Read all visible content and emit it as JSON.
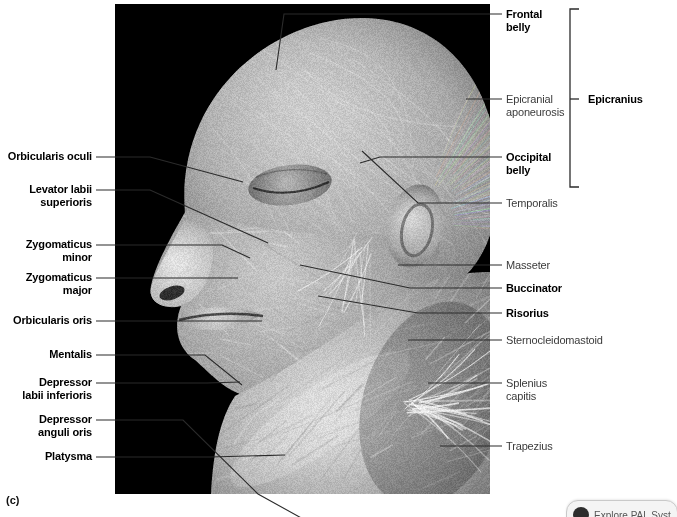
{
  "figure": {
    "panel_letter": "(c)",
    "photo": {
      "kind": "cadaver-dissection-photograph",
      "subject": "lateral view of human head and neck, superficial muscles",
      "palette": "grayscale",
      "background_color": "#000000"
    }
  },
  "labels_left": [
    {
      "id": "orbicularis-oculi",
      "text": "Orbicularis oculi",
      "weight": "bold",
      "text_right_x": 92,
      "text_y": 150,
      "lines": 1,
      "leader": [
        [
          96,
          157
        ],
        [
          150,
          157
        ],
        [
          243,
          182
        ]
      ]
    },
    {
      "id": "levator-labii-superioris",
      "text": "Levator labii\nsuperioris",
      "weight": "bold",
      "text_right_x": 92,
      "text_y": 183,
      "lines": 2,
      "leader": [
        [
          96,
          190
        ],
        [
          150,
          190
        ],
        [
          268,
          243
        ]
      ]
    },
    {
      "id": "zygomaticus-minor",
      "text": "Zygomaticus\nminor",
      "weight": "bold",
      "text_right_x": 92,
      "text_y": 238,
      "lines": 2,
      "leader": [
        [
          96,
          245
        ],
        [
          222,
          245
        ],
        [
          250,
          258
        ]
      ]
    },
    {
      "id": "zygomaticus-major",
      "text": "Zygomaticus\nmajor",
      "weight": "bold",
      "text_right_x": 92,
      "text_y": 271,
      "lines": 2,
      "leader": [
        [
          96,
          278
        ],
        [
          238,
          278
        ]
      ]
    },
    {
      "id": "orbicularis-oris",
      "text": "Orbicularis oris",
      "weight": "bold",
      "text_right_x": 92,
      "text_y": 314,
      "lines": 1,
      "leader": [
        [
          96,
          321
        ],
        [
          262,
          321
        ]
      ]
    },
    {
      "id": "mentalis",
      "text": "Mentalis",
      "weight": "bold",
      "text_right_x": 92,
      "text_y": 348,
      "lines": 1,
      "leader": [
        [
          96,
          355
        ],
        [
          205,
          355
        ],
        [
          242,
          385
        ]
      ]
    },
    {
      "id": "depressor-labii-inferioris",
      "text": "Depressor\nlabii inferioris",
      "weight": "bold",
      "text_right_x": 92,
      "text_y": 376,
      "lines": 2,
      "leader": [
        [
          96,
          383
        ],
        [
          207,
          383
        ],
        [
          240,
          382
        ]
      ]
    },
    {
      "id": "depressor-anguli-oris",
      "text": "Depressor\nanguli oris",
      "weight": "bold",
      "text_right_x": 92,
      "text_y": 413,
      "lines": 2,
      "leader": [
        [
          96,
          420
        ],
        [
          183,
          420
        ],
        [
          258,
          494
        ],
        [
          341,
          540
        ]
      ]
    },
    {
      "id": "platysma",
      "text": "Platysma",
      "weight": "bold",
      "text_right_x": 92,
      "text_y": 450,
      "lines": 1,
      "leader": [
        [
          96,
          457
        ],
        [
          210,
          457
        ],
        [
          285,
          455
        ]
      ]
    }
  ],
  "labels_right": [
    {
      "id": "frontal-belly",
      "text": "Frontal\nbelly",
      "weight": "bold",
      "text_left_x": 506,
      "text_y": 8,
      "lines": 2,
      "leader": [
        [
          502,
          14
        ],
        [
          284,
          14
        ],
        [
          276,
          70
        ]
      ]
    },
    {
      "id": "epicranial-aponeurosis",
      "text": "Epicranial\naponeurosis",
      "weight": "reg",
      "text_left_x": 506,
      "text_y": 93,
      "lines": 2,
      "leader": [
        [
          502,
          99
        ],
        [
          466,
          99
        ]
      ]
    },
    {
      "id": "occipital-belly",
      "text": "Occipital\nbelly",
      "weight": "bold",
      "text_left_x": 506,
      "text_y": 151,
      "lines": 2,
      "leader": [
        [
          502,
          157
        ],
        [
          380,
          157
        ],
        [
          360,
          163
        ]
      ]
    },
    {
      "id": "temporalis",
      "text": "Temporalis",
      "weight": "reg",
      "text_left_x": 506,
      "text_y": 197,
      "lines": 1,
      "leader": [
        [
          502,
          203
        ],
        [
          418,
          203
        ],
        [
          362,
          151
        ]
      ]
    },
    {
      "id": "masseter",
      "text": "Masseter",
      "weight": "reg",
      "text_left_x": 506,
      "text_y": 259,
      "lines": 1,
      "leader": [
        [
          502,
          265
        ],
        [
          398,
          265
        ]
      ]
    },
    {
      "id": "buccinator",
      "text": "Buccinator",
      "weight": "bold",
      "text_left_x": 506,
      "text_y": 282,
      "lines": 1,
      "leader": [
        [
          502,
          288
        ],
        [
          410,
          288
        ],
        [
          300,
          265
        ]
      ]
    },
    {
      "id": "risorius",
      "text": "Risorius",
      "weight": "bold",
      "text_left_x": 506,
      "text_y": 307,
      "lines": 1,
      "leader": [
        [
          502,
          313
        ],
        [
          418,
          313
        ],
        [
          318,
          296
        ]
      ]
    },
    {
      "id": "sternocleidomastoid",
      "text": "Sternocleidomastoid",
      "weight": "reg",
      "text_left_x": 506,
      "text_y": 334,
      "lines": 1,
      "leader": [
        [
          502,
          340
        ],
        [
          408,
          340
        ]
      ]
    },
    {
      "id": "splenius-capitis",
      "text": "Splenius\ncapitis",
      "weight": "reg",
      "text_left_x": 506,
      "text_y": 377,
      "lines": 2,
      "leader": [
        [
          502,
          383
        ],
        [
          428,
          383
        ]
      ]
    },
    {
      "id": "trapezius",
      "text": "Trapezius",
      "weight": "reg",
      "text_left_x": 506,
      "text_y": 440,
      "lines": 1,
      "leader": [
        [
          502,
          446
        ],
        [
          440,
          446
        ]
      ]
    }
  ],
  "bracket": {
    "label": "Epicranius",
    "weight": "bold",
    "x": 570,
    "top_y": 9,
    "bottom_y": 187,
    "tick_y": 99,
    "label_x": 588,
    "label_y": 93
  },
  "bottom_widget": {
    "visible_fragment": "Explore  PAL  Systems",
    "clipped": true
  },
  "colors": {
    "page_background": "#ffffff",
    "photo_background": "#000000",
    "bold_label": "#000000",
    "regular_label": "#3b3b3b",
    "leader_line": "#2b2b2b",
    "bracket": "#2b2b2b"
  }
}
